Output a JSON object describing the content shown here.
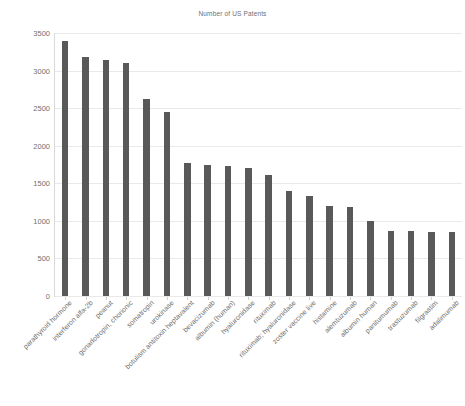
{
  "chart": {
    "title": "Number of US Patents"
  },
  "chart_data": {
    "type": "bar",
    "title": "Number of US Patents",
    "xlabel": "",
    "ylabel": "",
    "ylim": [
      0,
      3500
    ],
    "yticks": [
      0,
      500,
      1000,
      1500,
      2000,
      2500,
      3000,
      3500
    ],
    "ytick_labels": [
      "0",
      "500",
      "1000",
      "1500",
      "2000",
      "2500",
      "3000",
      "3500"
    ],
    "grid": true,
    "legend": "none",
    "bar_color": "#595959",
    "categories": [
      "parathyroid hormone",
      "interferon alfa-2b",
      "peanut",
      "gonadotropin, chorionic",
      "somatropin",
      "urokinase",
      "botulism antitoxin heptavalent",
      "bevacizumab",
      "albumin (human)",
      "hyaluronidase",
      "rituximab",
      "rituximab; hyaluronidase",
      "zoster vaccine live",
      "histamine",
      "alemtuzumab",
      "albumin human",
      "panitumumab",
      "trastuzumab",
      "filgrastim",
      "adalimumab"
    ],
    "values": [
      3400,
      3180,
      3140,
      3100,
      2620,
      2450,
      1770,
      1740,
      1730,
      1700,
      1610,
      1400,
      1330,
      1200,
      1180,
      1000,
      870,
      870,
      855,
      850
    ]
  }
}
